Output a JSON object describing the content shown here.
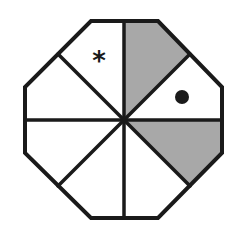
{
  "diagram": {
    "shape": "regular octagon",
    "divisions": 8,
    "colors": {
      "background": "#ffffff",
      "outline": "#1a1a1a",
      "shaded": "#a8a8a8",
      "unshaded": "#ffffff"
    },
    "sectors": [
      {
        "id": "top-right",
        "shaded": true,
        "marker": ""
      },
      {
        "id": "right-top",
        "shaded": false,
        "marker": "dot"
      },
      {
        "id": "right-bottom",
        "shaded": true,
        "marker": ""
      },
      {
        "id": "bottom-right",
        "shaded": false,
        "marker": ""
      },
      {
        "id": "bottom-left",
        "shaded": false,
        "marker": ""
      },
      {
        "id": "left-bottom",
        "shaded": false,
        "marker": ""
      },
      {
        "id": "left-top",
        "shaded": false,
        "marker": ""
      },
      {
        "id": "top-left",
        "shaded": false,
        "marker": "asterisk"
      }
    ],
    "markers": {
      "asterisk": "*",
      "dot": "●"
    }
  }
}
